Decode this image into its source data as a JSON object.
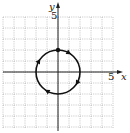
{
  "figure": {
    "type": "parametric-curve-on-grid",
    "x_axis": {
      "label": "x",
      "tick_label": "5",
      "range": [
        -5,
        5
      ]
    },
    "y_axis": {
      "label": "y",
      "tick_label": "5",
      "range": [
        -5,
        5
      ]
    },
    "grid": {
      "on": true,
      "spacing": 1,
      "style": "dotted"
    },
    "curve": {
      "shape": "circle",
      "center": [
        0,
        0
      ],
      "radius": 2,
      "orientation": "clockwise",
      "start_point": [
        0,
        2
      ],
      "arrow_count": 4
    }
  }
}
